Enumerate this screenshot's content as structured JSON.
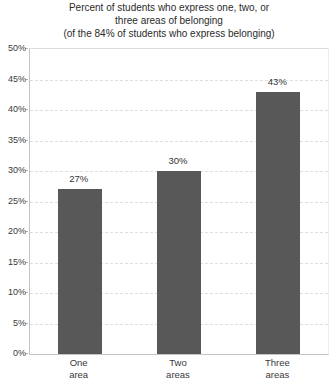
{
  "chart_data": {
    "type": "bar",
    "title_lines": [
      "Percent of students who express one, two, or",
      "three areas of belonging",
      "(of the 84% of students who express belonging)"
    ],
    "title": "Percent of students who express one, two, or three areas of belonging (of the 84% of students who express belonging)",
    "categories": [
      "One area",
      "Two areas",
      "Three areas"
    ],
    "category_lines": [
      [
        "One",
        "area"
      ],
      [
        "Two",
        "areas"
      ],
      [
        "Three",
        "areas"
      ]
    ],
    "values": [
      27,
      30,
      43
    ],
    "value_labels": [
      "27%",
      "30%",
      "43%"
    ],
    "xlabel": "",
    "ylabel": "",
    "ylim": [
      0,
      50
    ],
    "ytick_step": 5,
    "ytick_labels": [
      "0%",
      "5%",
      "10%",
      "15%",
      "20%",
      "25%",
      "30%",
      "35%",
      "40%",
      "45%",
      "50%"
    ],
    "grid": true,
    "legend": "none",
    "colors": {
      "bar": "#585858",
      "grid": "#dedede",
      "axis": "#c4c4c4",
      "text": "#3a3a3a",
      "title": "#2b2b2b",
      "background": "#ffffff"
    }
  }
}
